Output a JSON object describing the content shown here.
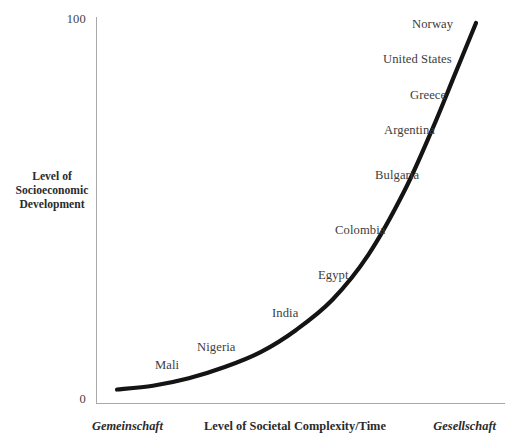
{
  "chart_data": {
    "type": "line",
    "title": "",
    "xlabel": "Level of Societal Complexity/Time",
    "ylabel": "Level of Socioeconomic Development",
    "xlabel_left": "Gemeinschaft",
    "xlabel_right": "Gesellschaft",
    "ylim": [
      0,
      100
    ],
    "y_ticks": [
      "0",
      "100"
    ],
    "x_ticks": [],
    "grid": false,
    "legend": null,
    "series": [
      {
        "name": "Socioeconomic development curve",
        "description": "Exponential curve rising from near 0 at left to 100 at right",
        "x": [
          0,
          10,
          20,
          30,
          40,
          50,
          60,
          70,
          80,
          88,
          94,
          100
        ],
        "y": [
          2,
          3,
          5,
          8,
          12,
          18,
          26,
          38,
          55,
          72,
          86,
          100
        ]
      }
    ],
    "annotations": [
      {
        "label": "Mali",
        "x": 17,
        "y": 13
      },
      {
        "label": "Nigeria",
        "x": 28,
        "y": 18
      },
      {
        "label": "India",
        "x": 47,
        "y": 27
      },
      {
        "label": "Egypt",
        "x": 58,
        "y": 38
      },
      {
        "label": "Colombia",
        "x": 64,
        "y": 50
      },
      {
        "label": "Bulgaria",
        "x": 73,
        "y": 63
      },
      {
        "label": "Argentina",
        "x": 76,
        "y": 75
      },
      {
        "label": "Greece",
        "x": 83,
        "y": 84
      },
      {
        "label": "United States",
        "x": 82,
        "y": 93
      },
      {
        "label": "Norway",
        "x": 89,
        "y": 100
      }
    ]
  },
  "axes": {
    "y_top_tick": "100",
    "y_bottom_tick": "0",
    "y_title": "Level of\nSocioeconomic\nDevelopment",
    "y_title_line1": "Level of",
    "y_title_line2": "Socioeconomic",
    "y_title_line3": "Development",
    "x_title": "Level of Societal Complexity/Time",
    "x_left_pole": "Gemeinschaft",
    "x_right_pole": "Gesellschaft"
  },
  "labels": {
    "mali": "Mali",
    "nigeria": "Nigeria",
    "india": "India",
    "egypt": "Egypt",
    "colombia": "Colombia",
    "bulgaria": "Bulgaria",
    "argentina": "Argentina",
    "greece": "Greece",
    "united_states": "United States",
    "norway": "Norway"
  },
  "colors": {
    "curve": "#141414",
    "axis": "#a9a9a9",
    "text": "#3d3d3d",
    "title_text": "#2b2b2b",
    "background": "#ffffff"
  }
}
